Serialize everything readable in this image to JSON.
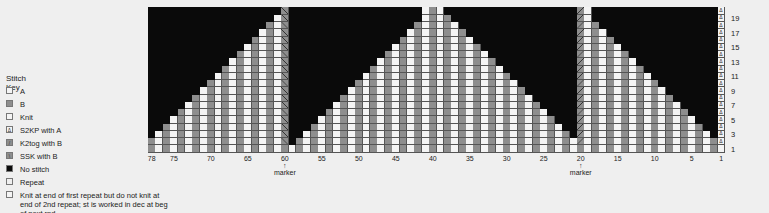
{
  "key": {
    "title": "Stitch Key",
    "items": [
      {
        "name": "a",
        "label": "A",
        "swatch": "#f4f4f4"
      },
      {
        "name": "b",
        "label": "B",
        "swatch": "#8e8e8e"
      },
      {
        "name": "knit",
        "label": "Knit",
        "swatch": "#f4f4f4"
      },
      {
        "name": "s2kp-a",
        "label": "S2KP with A",
        "swatch": "#f4f4f4",
        "glyph": "Δ"
      },
      {
        "name": "k2tog-b",
        "label": "K2tog with B",
        "swatch": "#8e8e8e",
        "glyph": "/"
      },
      {
        "name": "ssk-b",
        "label": "SSK with B",
        "swatch": "#8e8e8e",
        "glyph": "\\"
      },
      {
        "name": "no-stitch",
        "label": "No stitch",
        "swatch": "#0a0a0a"
      },
      {
        "name": "repeat",
        "label": "Repeat",
        "swatch": "#efefef"
      },
      {
        "name": "knit-end",
        "label": "Knit at end of first repeat but do not knit at end of 2nd repeat; st is worked in dec at beg of next rnd",
        "swatch": "#f4f4f4"
      }
    ]
  },
  "colors": {
    "A": "#f4f4f4",
    "B": "#8e8e8e",
    "none": "#0a0a0a",
    "background": "#efefef"
  },
  "chart_data": {
    "type": "table",
    "columns": 78,
    "rows": 20,
    "column_order": "78 (left) to 1 (right)",
    "row_labels": [
      "1",
      "3",
      "5",
      "7",
      "9",
      "11",
      "13",
      "15",
      "17",
      "19"
    ],
    "column_labels": [
      "78",
      "75",
      "70",
      "65",
      "60",
      "55",
      "50",
      "45",
      "40",
      "35",
      "30",
      "25",
      "20",
      "15",
      "10",
      "5",
      "1"
    ],
    "markers": [
      {
        "column": 60,
        "label": "marker"
      },
      {
        "column": 20,
        "label": "marker"
      }
    ],
    "color_rule": "even columns = B, odd columns = A",
    "special_columns": {
      "60": "K2tog with B (rows 2-20), B at row 1",
      "20": "SSK with B (rows 2-20), B at row 1",
      "1": "S2KP with A (rows 2-20), A at row 1"
    },
    "column_heights": {
      "61-78": "80 - col",
      "41-59": "60 - col",
      "39-41": 20,
      "21-38": "col - 20",
      "2-19": "col (col 19 = 20)"
    }
  }
}
